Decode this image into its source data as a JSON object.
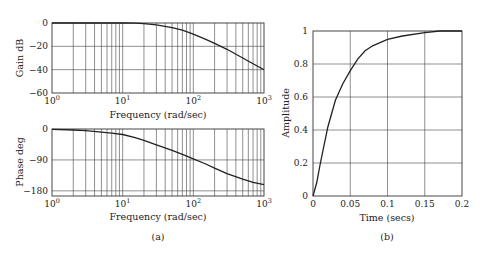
{
  "chart_data": [
    {
      "id": "gain",
      "type": "line",
      "title": "",
      "xlabel": "Frequency (rad/sec)",
      "ylabel": "Gain dB",
      "xscale": "log",
      "xlim": [
        1,
        1000
      ],
      "ylim": [
        -60,
        0
      ],
      "xticks": [
        "10^0",
        "10^1",
        "10^2",
        "10^3"
      ],
      "yticks": [
        0,
        -20,
        -40,
        -60
      ],
      "grid": true,
      "series": [
        {
          "name": "gain",
          "x": [
            1,
            5,
            10,
            15,
            20,
            30,
            50,
            70,
            100,
            150,
            200,
            300,
            500,
            700,
            1000
          ],
          "y": [
            0,
            0,
            0,
            -0.2,
            -0.6,
            -1.6,
            -4,
            -6.2,
            -9.5,
            -14,
            -17.5,
            -22.5,
            -30,
            -35,
            -40
          ]
        }
      ]
    },
    {
      "id": "phase",
      "type": "line",
      "title": "",
      "xlabel": "Frequency (rad/sec)",
      "ylabel": "Phase deg",
      "xscale": "log",
      "xlim": [
        1,
        1000
      ],
      "ylim": [
        -195,
        0
      ],
      "xticks": [
        "10^0",
        "10^1",
        "10^2",
        "10^3"
      ],
      "yticks": [
        0,
        -90,
        -180
      ],
      "grid": true,
      "series": [
        {
          "name": "phase",
          "x": [
            1,
            2,
            3,
            5,
            7,
            10,
            15,
            20,
            30,
            50,
            70,
            100,
            150,
            200,
            300,
            500,
            700,
            1000
          ],
          "y": [
            -1,
            -3,
            -5,
            -9,
            -12,
            -16,
            -25,
            -33,
            -46,
            -62,
            -74,
            -87,
            -102,
            -114,
            -130,
            -146,
            -155,
            -162
          ]
        }
      ]
    },
    {
      "id": "step",
      "type": "line",
      "title": "",
      "xlabel": "Time (secs)",
      "ylabel": "Amplitude",
      "xlim": [
        0,
        0.2
      ],
      "ylim": [
        0,
        1
      ],
      "xticks": [
        "0",
        "0.05",
        "0.1",
        "0.15",
        "0.2"
      ],
      "yticks": [
        "0",
        "0.2",
        "0.4",
        "0.6",
        "0.8",
        "1"
      ],
      "grid": true,
      "series": [
        {
          "name": "step response",
          "x": [
            0,
            0.005,
            0.01,
            0.02,
            0.03,
            0.04,
            0.05,
            0.06,
            0.07,
            0.08,
            0.1,
            0.12,
            0.15,
            0.17,
            0.2
          ],
          "y": [
            0,
            0.08,
            0.2,
            0.42,
            0.58,
            0.68,
            0.76,
            0.83,
            0.88,
            0.91,
            0.95,
            0.97,
            0.99,
            1.0,
            1.0
          ]
        }
      ]
    }
  ],
  "captions": {
    "a": "(a)",
    "b": "(b)"
  },
  "labels": {
    "gain_ylabel": "Gain dB",
    "phase_ylabel": "Phase deg",
    "freq_xlabel": "Frequency (rad/sec)",
    "amp_ylabel": "Amplitude",
    "time_xlabel": "Time (secs)"
  }
}
